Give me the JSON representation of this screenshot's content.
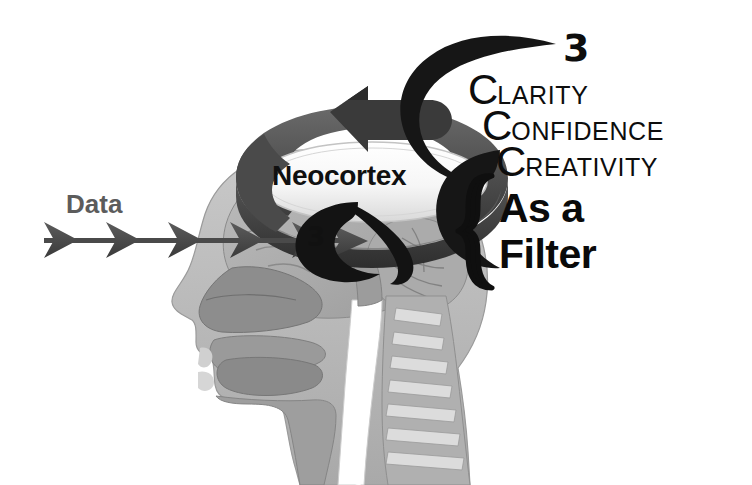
{
  "image": {
    "title": "Neocortex as a Filter diagram",
    "background_color": "#ffffff",
    "width": 752,
    "height": 485
  },
  "labels": {
    "data": "Data",
    "neocortex": "Neocortex",
    "three_top": "3",
    "three_small": "3"
  },
  "three_cs": {
    "heading_number": "3",
    "items": [
      {
        "initial": "C",
        "rest": "LARITY"
      },
      {
        "initial": "C",
        "rest": "ONFIDENCE"
      },
      {
        "initial": "C",
        "rest": "REATIVITY"
      }
    ]
  },
  "filter": {
    "line1": "As a",
    "line2": "Filter"
  },
  "colors": {
    "background": "#ffffff",
    "text_dark": "#0d0d0d",
    "data_label": "#5c5c5c",
    "ring_dark": "#3f3f3f",
    "ring_mid": "#565656",
    "ring_light": "#6e6e6e",
    "arrow_dark": "#4a4a4a",
    "swoosh_black": "#111111",
    "anatomy_mid": "#8f8f8f",
    "anatomy_light": "#b4b4b4",
    "anatomy_pale": "#cfcfcf",
    "anatomy_dark": "#6f6f6f",
    "oval_fill": "#f4f4f4"
  },
  "icons": {
    "ring": "circular-arrow-ring-icon",
    "data_arrow": "chevron-arrow-icon",
    "brace": "curly-brace-icon",
    "swoosh": "crescent-swoosh-icon",
    "head": "sagittal-head-anatomy-icon"
  }
}
